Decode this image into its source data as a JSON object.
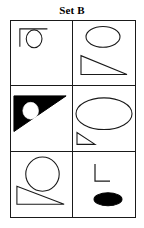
{
  "page": {
    "title": "Set B",
    "background_color": "#ffffff",
    "stroke_color": "#1a1a1a",
    "fill_color": "#000000"
  },
  "grid": {
    "columns": 2,
    "rows": 3,
    "border_color": "#1a1a1a",
    "cells": [
      {
        "id": "cell-1",
        "position": "top-left",
        "shapes": [
          {
            "name": "corner-angle-shape",
            "kind": "angle",
            "fill": "none",
            "stroke": "#1a1a1a"
          },
          {
            "name": "small-circle-shape",
            "kind": "circle",
            "fill": "none",
            "stroke": "#1a1a1a"
          }
        ]
      },
      {
        "id": "cell-2",
        "position": "top-right",
        "shapes": [
          {
            "name": "ellipse-shape",
            "kind": "ellipse",
            "fill": "none",
            "stroke": "#1a1a1a"
          },
          {
            "name": "right-triangle-shape",
            "kind": "triangle",
            "fill": "none",
            "stroke": "#1a1a1a"
          }
        ]
      },
      {
        "id": "cell-3",
        "position": "middle-left",
        "shapes": [
          {
            "name": "filled-triangle-shape",
            "kind": "triangle",
            "fill": "#000000",
            "stroke": "#000000"
          },
          {
            "name": "white-circle-shape",
            "kind": "circle",
            "fill": "#ffffff",
            "stroke": "#ffffff"
          }
        ]
      },
      {
        "id": "cell-4",
        "position": "middle-right",
        "shapes": [
          {
            "name": "large-ellipse-shape",
            "kind": "ellipse",
            "fill": "none",
            "stroke": "#1a1a1a"
          },
          {
            "name": "small-triangle-shape",
            "kind": "triangle",
            "fill": "none",
            "stroke": "#1a1a1a"
          }
        ]
      },
      {
        "id": "cell-5",
        "position": "bottom-left",
        "shapes": [
          {
            "name": "large-circle-shape",
            "kind": "circle",
            "fill": "none",
            "stroke": "#1a1a1a"
          },
          {
            "name": "right-triangle-shape",
            "kind": "triangle",
            "fill": "none",
            "stroke": "#1a1a1a"
          }
        ]
      },
      {
        "id": "cell-6",
        "position": "bottom-right",
        "shapes": [
          {
            "name": "l-angle-shape",
            "kind": "angle",
            "fill": "none",
            "stroke": "#1a1a1a"
          },
          {
            "name": "filled-ellipse-shape",
            "kind": "ellipse",
            "fill": "#000000",
            "stroke": "#000000"
          }
        ]
      }
    ]
  }
}
